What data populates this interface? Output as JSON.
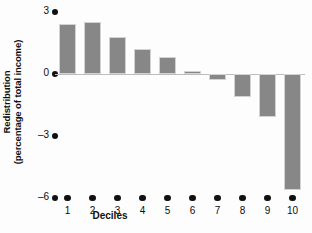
{
  "chart_data": {
    "type": "bar",
    "title": "",
    "xlabel": "Deciles",
    "ylabel_line1": "Redistribution",
    "ylabel_line2": "(percentage of total income)",
    "categories": [
      "1",
      "2",
      "3",
      "4",
      "5",
      "6",
      "7",
      "8",
      "9",
      "10"
    ],
    "values": [
      2.4,
      2.5,
      1.8,
      1.2,
      0.8,
      0.15,
      -0.3,
      -1.1,
      -2.1,
      -5.6
    ],
    "ylim": [
      -6,
      3
    ],
    "yticks": [
      3,
      0,
      -3,
      -6
    ],
    "ytick_labels": [
      "3",
      "0",
      "–3",
      "–6"
    ],
    "grid": false,
    "legend": null,
    "bar_color": "#878787",
    "bar_edge_color": "#d3d3d3",
    "axis_color": "#111111",
    "baseline_color": "#bdbdbd",
    "background": "#fdfdfd"
  }
}
